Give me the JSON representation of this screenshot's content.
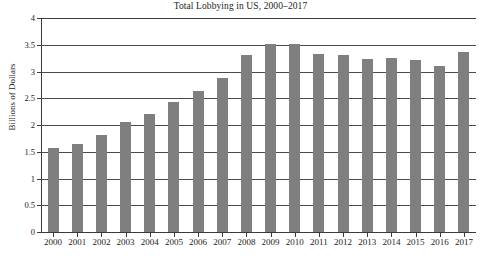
{
  "chart_data": {
    "type": "bar",
    "title": "Total Lobbying in US, 2000–2017",
    "xlabel": "",
    "ylabel": "Billions of Dollars",
    "ylim": [
      0,
      4
    ],
    "yticks": [
      "0",
      "0.5",
      "1",
      "1.5",
      "2",
      "2.5",
      "3",
      "3.5",
      "4"
    ],
    "ytick_values": [
      0,
      0.5,
      1,
      1.5,
      2,
      2.5,
      3,
      3.5,
      4
    ],
    "grid": true,
    "legend": "none",
    "bar_color": "#7f7f7f",
    "categories": [
      "2000",
      "2001",
      "2002",
      "2003",
      "2004",
      "2005",
      "2006",
      "2007",
      "2008",
      "2009",
      "2010",
      "2011",
      "2012",
      "2013",
      "2014",
      "2015",
      "2016",
      "2017"
    ],
    "values": [
      1.57,
      1.64,
      1.82,
      2.05,
      2.2,
      2.43,
      2.63,
      2.87,
      3.3,
      3.51,
      3.52,
      3.32,
      3.3,
      3.23,
      3.25,
      3.22,
      3.1,
      3.37
    ]
  }
}
